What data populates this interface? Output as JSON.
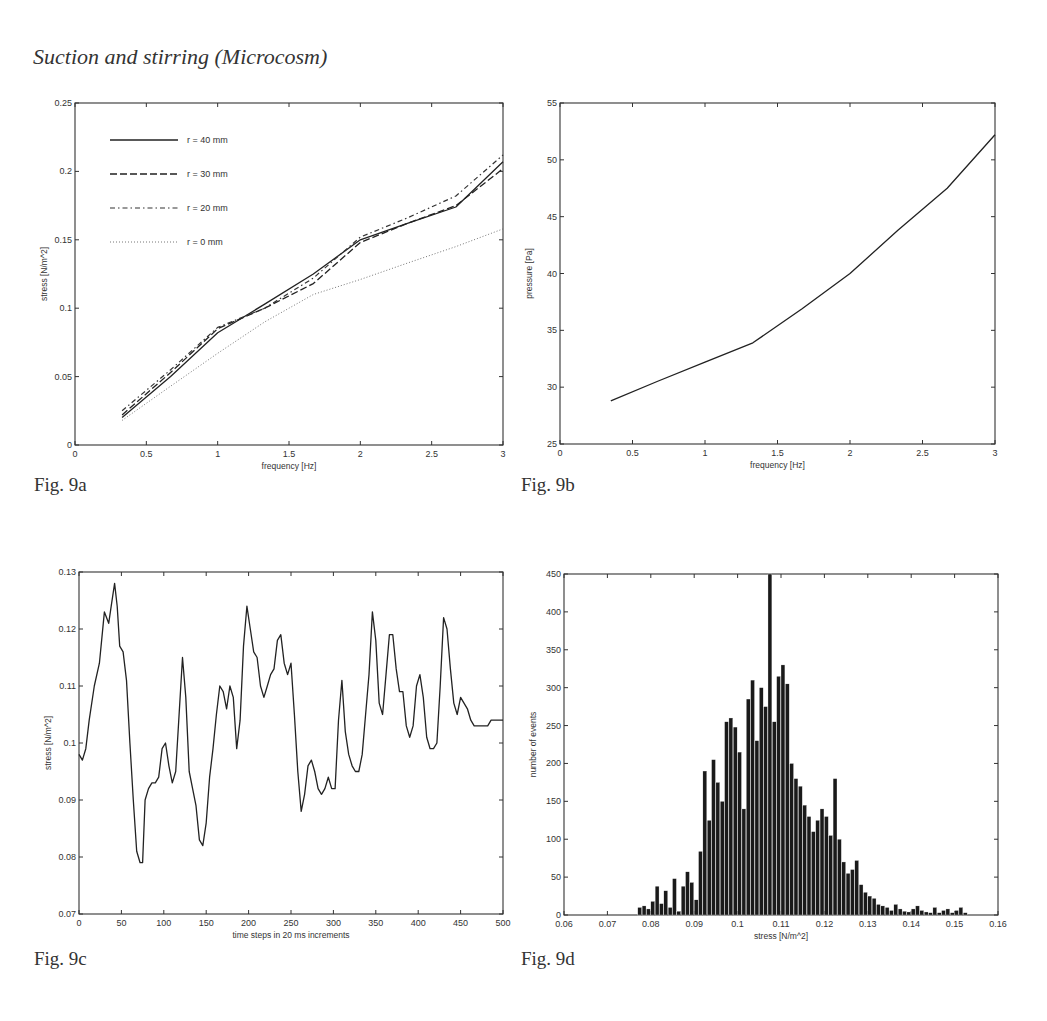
{
  "page": {
    "heading": "Suction and stirring (Microcosm)",
    "figures": [
      {
        "id": "fig9a",
        "caption": "Fig. 9a"
      },
      {
        "id": "fig9b",
        "caption": "Fig. 9b"
      },
      {
        "id": "fig9c",
        "caption": "Fig. 9c"
      },
      {
        "id": "fig9d",
        "caption": "Fig. 9d"
      }
    ]
  },
  "chart_data": [
    {
      "id": "fig9a",
      "type": "line",
      "title": "",
      "xlabel": "frequency [Hz]",
      "ylabel": "stress [N/m^2]",
      "xlim": [
        0,
        3
      ],
      "ylim": [
        0,
        0.25
      ],
      "xticks": [
        0,
        0.5,
        1,
        1.5,
        2,
        2.5,
        3
      ],
      "xtick_labels": [
        "0",
        "0.5",
        "1",
        "1.5",
        "2",
        "2.5",
        "3"
      ],
      "yticks": [
        0,
        0.05,
        0.1,
        0.15,
        0.2,
        0.25
      ],
      "ytick_labels": [
        "0",
        "0.05",
        "0.1",
        "0.15",
        "0.2",
        "0.25"
      ],
      "grid": false,
      "legend_position": "upper left",
      "x": [
        0.33,
        0.67,
        1.0,
        1.33,
        1.67,
        2.0,
        2.33,
        2.67,
        3.0
      ],
      "series": [
        {
          "name": "r = 40 mm",
          "style": "solid",
          "values": [
            0.02,
            0.05,
            0.082,
            0.103,
            0.125,
            0.15,
            0.162,
            0.174,
            0.207
          ]
        },
        {
          "name": "r = 30 mm",
          "style": "dashed",
          "values": [
            0.022,
            0.053,
            0.085,
            0.1,
            0.118,
            0.148,
            0.162,
            0.175,
            0.202
          ]
        },
        {
          "name": "r = 20 mm",
          "style": "dashdot",
          "values": [
            0.025,
            0.055,
            0.086,
            0.1,
            0.122,
            0.152,
            0.166,
            0.182,
            0.212
          ]
        },
        {
          "name": "r = 0 mm",
          "style": "dotted",
          "values": [
            0.018,
            0.043,
            0.067,
            0.09,
            0.11,
            0.121,
            0.133,
            0.145,
            0.158
          ]
        }
      ],
      "plot_box": {
        "left": 75,
        "top": 103,
        "right": 503,
        "bottom": 445
      }
    },
    {
      "id": "fig9b",
      "type": "line",
      "title": "",
      "xlabel": "frequency [Hz]",
      "ylabel": "pressure [Pa]",
      "xlim": [
        0,
        3
      ],
      "ylim": [
        25,
        55
      ],
      "xticks": [
        0,
        0.5,
        1,
        1.5,
        2,
        2.5,
        3
      ],
      "xtick_labels": [
        "0",
        "0.5",
        "1",
        "1.5",
        "2",
        "2.5",
        "3"
      ],
      "yticks": [
        25,
        30,
        35,
        40,
        45,
        50,
        55
      ],
      "ytick_labels": [
        "25",
        "30",
        "35",
        "40",
        "45",
        "50",
        "55"
      ],
      "grid": false,
      "x": [
        0.35,
        0.67,
        1.0,
        1.33,
        1.67,
        2.0,
        2.33,
        2.67,
        3.0
      ],
      "series": [
        {
          "name": "pressure",
          "style": "solid",
          "values": [
            28.8,
            30.5,
            32.2,
            33.9,
            36.9,
            40.0,
            43.8,
            47.5,
            52.2
          ]
        }
      ],
      "plot_box": {
        "left": 560,
        "top": 103,
        "right": 995,
        "bottom": 444
      }
    },
    {
      "id": "fig9c",
      "type": "line",
      "title": "",
      "xlabel": "time steps in 20 ms increments",
      "ylabel": "stress [N/m^2]",
      "xlim": [
        0,
        500
      ],
      "ylim": [
        0.07,
        0.13
      ],
      "xticks": [
        0,
        50,
        100,
        150,
        200,
        250,
        300,
        350,
        400,
        450,
        500
      ],
      "xtick_labels": [
        "0",
        "50",
        "100",
        "150",
        "200",
        "250",
        "300",
        "350",
        "400",
        "450",
        "500"
      ],
      "yticks": [
        0.07,
        0.08,
        0.09,
        0.1,
        0.11,
        0.12,
        0.13
      ],
      "ytick_labels": [
        "0.07",
        "0.08",
        "0.09",
        "0.1",
        "0.11",
        "0.12",
        "0.13"
      ],
      "grid": false,
      "x": [
        0,
        4,
        8,
        12,
        18,
        24,
        30,
        35,
        38,
        42,
        45,
        48,
        52,
        56,
        60,
        64,
        68,
        72,
        75,
        78,
        82,
        86,
        90,
        94,
        98,
        102,
        106,
        110,
        114,
        118,
        122,
        126,
        130,
        134,
        138,
        142,
        146,
        150,
        154,
        158,
        162,
        166,
        170,
        174,
        178,
        182,
        186,
        190,
        194,
        198,
        202,
        206,
        210,
        214,
        218,
        222,
        226,
        230,
        234,
        238,
        242,
        246,
        250,
        254,
        258,
        262,
        266,
        270,
        274,
        278,
        282,
        286,
        290,
        294,
        298,
        302,
        306,
        310,
        314,
        318,
        322,
        326,
        330,
        334,
        338,
        342,
        346,
        350,
        354,
        358,
        362,
        366,
        370,
        374,
        378,
        382,
        386,
        390,
        394,
        398,
        402,
        406,
        410,
        414,
        418,
        422,
        426,
        430,
        434,
        438,
        442,
        446,
        450,
        454,
        458,
        462,
        466,
        470,
        474,
        478,
        482,
        486,
        490,
        494,
        498,
        500
      ],
      "series": [
        {
          "name": "stress",
          "style": "solid",
          "values": [
            0.098,
            0.097,
            0.099,
            0.104,
            0.11,
            0.114,
            0.123,
            0.121,
            0.124,
            0.128,
            0.124,
            0.117,
            0.116,
            0.111,
            0.1,
            0.09,
            0.081,
            0.079,
            0.079,
            0.09,
            0.092,
            0.093,
            0.093,
            0.094,
            0.099,
            0.1,
            0.096,
            0.093,
            0.095,
            0.105,
            0.115,
            0.108,
            0.095,
            0.092,
            0.089,
            0.083,
            0.082,
            0.086,
            0.094,
            0.099,
            0.105,
            0.11,
            0.109,
            0.106,
            0.11,
            0.108,
            0.099,
            0.104,
            0.117,
            0.124,
            0.12,
            0.116,
            0.115,
            0.11,
            0.108,
            0.11,
            0.112,
            0.113,
            0.118,
            0.119,
            0.114,
            0.112,
            0.114,
            0.105,
            0.095,
            0.088,
            0.091,
            0.096,
            0.097,
            0.095,
            0.092,
            0.091,
            0.092,
            0.094,
            0.092,
            0.092,
            0.104,
            0.111,
            0.102,
            0.098,
            0.096,
            0.095,
            0.095,
            0.098,
            0.105,
            0.112,
            0.123,
            0.118,
            0.107,
            0.105,
            0.112,
            0.119,
            0.119,
            0.113,
            0.109,
            0.109,
            0.103,
            0.101,
            0.103,
            0.11,
            0.112,
            0.108,
            0.101,
            0.099,
            0.099,
            0.1,
            0.11,
            0.122,
            0.12,
            0.113,
            0.107,
            0.105,
            0.108,
            0.107,
            0.106,
            0.104,
            0.103,
            0.103,
            0.103,
            0.103,
            0.103,
            0.104,
            0.104,
            0.104,
            0.104,
            0.104
          ]
        }
      ],
      "plot_box": {
        "left": 79,
        "top": 572,
        "right": 503,
        "bottom": 914
      }
    },
    {
      "id": "fig9d",
      "type": "bar",
      "title": "",
      "xlabel": "stress [N/m^2]",
      "ylabel": "number of events",
      "xlim": [
        0.06,
        0.16
      ],
      "ylim": [
        0,
        450
      ],
      "xticks": [
        0.06,
        0.07,
        0.08,
        0.09,
        0.1,
        0.11,
        0.12,
        0.13,
        0.14,
        0.15,
        0.16
      ],
      "xtick_labels": [
        "0.06",
        "0.07",
        "0.08",
        "0.09",
        "0.1",
        "0.11",
        "0.12",
        "0.13",
        "0.14",
        "0.15",
        "0.16"
      ],
      "yticks": [
        0,
        50,
        100,
        150,
        200,
        250,
        300,
        350,
        400,
        450
      ],
      "ytick_labels": [
        "0",
        "50",
        "100",
        "150",
        "200",
        "250",
        "300",
        "350",
        "400",
        "450"
      ],
      "grid": false,
      "bin_centers": [
        0.0775,
        0.0785,
        0.0795,
        0.0805,
        0.0815,
        0.0825,
        0.0835,
        0.0845,
        0.0855,
        0.0865,
        0.0875,
        0.0885,
        0.0895,
        0.0905,
        0.0915,
        0.0925,
        0.0935,
        0.0945,
        0.0955,
        0.0965,
        0.0975,
        0.0985,
        0.0995,
        0.1005,
        0.1015,
        0.1025,
        0.1035,
        0.1045,
        0.1055,
        0.1065,
        0.1075,
        0.1085,
        0.1095,
        0.1105,
        0.1115,
        0.1125,
        0.1135,
        0.1145,
        0.1155,
        0.1165,
        0.1175,
        0.1185,
        0.1195,
        0.1205,
        0.1215,
        0.1225,
        0.1235,
        0.1245,
        0.1255,
        0.1265,
        0.1275,
        0.1285,
        0.1295,
        0.1305,
        0.1315,
        0.1325,
        0.1335,
        0.1345,
        0.1355,
        0.1365,
        0.1375,
        0.1385,
        0.1395,
        0.1405,
        0.1415,
        0.1425,
        0.1435,
        0.1445,
        0.1455,
        0.1465,
        0.1475,
        0.1485,
        0.1495,
        0.1505,
        0.1515,
        0.1525
      ],
      "values": [
        10,
        12,
        8,
        18,
        38,
        15,
        32,
        10,
        48,
        5,
        38,
        57,
        43,
        20,
        84,
        190,
        125,
        205,
        175,
        150,
        255,
        260,
        248,
        215,
        140,
        285,
        310,
        230,
        300,
        275,
        450,
        255,
        315,
        330,
        305,
        200,
        180,
        170,
        145,
        130,
        110,
        125,
        140,
        130,
        105,
        180,
        100,
        70,
        55,
        60,
        72,
        40,
        30,
        25,
        22,
        14,
        12,
        10,
        6,
        14,
        8,
        5,
        4,
        8,
        12,
        6,
        4,
        3,
        10,
        3,
        6,
        8,
        3,
        6,
        10,
        3
      ],
      "plot_box": {
        "left": 564,
        "top": 574,
        "right": 998,
        "bottom": 915
      }
    }
  ]
}
